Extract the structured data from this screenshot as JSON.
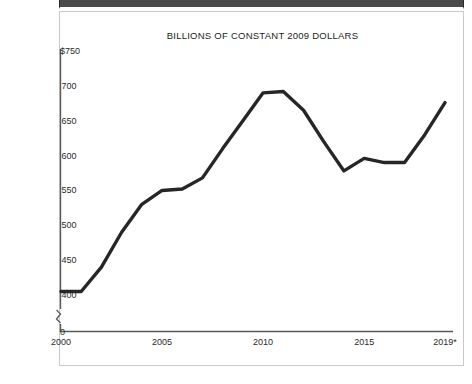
{
  "page": {
    "background_color": "#ffffff",
    "header_bar_color": "#4a4a4a",
    "card_border_color": "#c9c9c9"
  },
  "chart_data": {
    "type": "line",
    "title": "BILLIONS OF CONSTANT 2009 DOLLARS",
    "xlabel": "",
    "ylabel": "",
    "grid": false,
    "legend": null,
    "line_color": "#262626",
    "axis_color": "#5a5a5a",
    "axis_break": true,
    "axis_break_note": "y-axis broken between 0 and 400",
    "ylim": [
      400,
      750
    ],
    "yticks": [
      400,
      450,
      500,
      550,
      600,
      650,
      700,
      750
    ],
    "ytick_labels": [
      "400",
      "450",
      "500",
      "550",
      "600",
      "650",
      "700",
      "$750"
    ],
    "y_zero_label": "0",
    "xlim": [
      2000,
      2019
    ],
    "xticks": [
      2000,
      2005,
      2010,
      2015,
      2019
    ],
    "xtick_labels": [
      "2000",
      "2005",
      "2010",
      "2015",
      "2019*"
    ],
    "x": [
      2000,
      2001,
      2002,
      2003,
      2004,
      2005,
      2006,
      2007,
      2008,
      2009,
      2010,
      2011,
      2012,
      2013,
      2014,
      2015,
      2016,
      2017,
      2018,
      2019
    ],
    "values": [
      405,
      405,
      440,
      490,
      530,
      550,
      552,
      568,
      610,
      650,
      690,
      692,
      665,
      620,
      578,
      596,
      590,
      590,
      630,
      676
    ],
    "annotations": [
      "2019 value is marked with an asterisk (*) indicating a projected or estimated figure"
    ]
  }
}
